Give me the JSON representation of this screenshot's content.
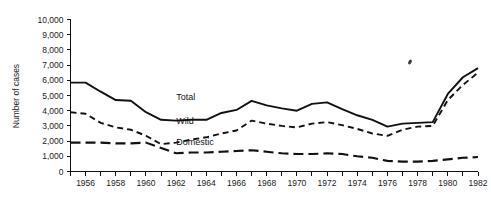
{
  "chart_data": {
    "type": "line",
    "title": "",
    "xlabel": "",
    "ylabel": "Number of cases",
    "xlim": [
      1955,
      1982
    ],
    "ylim": [
      0,
      10000
    ],
    "grid": false,
    "legend": "inline-labels",
    "y_ticks": [
      0,
      1000,
      2000,
      3000,
      4000,
      5000,
      6000,
      7000,
      8000,
      9000,
      10000
    ],
    "y_tick_labels": [
      "0",
      "1,000",
      "2,000",
      "3,000",
      "4,000",
      "5,000",
      "6,000",
      "7,000",
      "8,000",
      "9,000",
      "10,000"
    ],
    "x_ticks": [
      1955,
      1956,
      1957,
      1958,
      1959,
      1960,
      1961,
      1962,
      1963,
      1964,
      1965,
      1966,
      1967,
      1968,
      1969,
      1970,
      1971,
      1972,
      1973,
      1974,
      1975,
      1976,
      1977,
      1978,
      1979,
      1980,
      1981,
      1982
    ],
    "x_tick_labels": [
      "1956",
      "1958",
      "1960",
      "1962",
      "1964",
      "1966",
      "1968",
      "1970",
      "1972",
      "1974",
      "1976",
      "1978",
      "1980",
      "1982"
    ],
    "x_labeled_years": [
      1956,
      1958,
      1960,
      1962,
      1964,
      1966,
      1968,
      1970,
      1972,
      1974,
      1976,
      1978,
      1980,
      1982
    ],
    "x": [
      1955,
      1956,
      1957,
      1958,
      1959,
      1960,
      1961,
      1962,
      1963,
      1964,
      1965,
      1966,
      1967,
      1968,
      1969,
      1970,
      1971,
      1972,
      1973,
      1974,
      1975,
      1976,
      1977,
      1978,
      1979,
      1980,
      1981,
      1982
    ],
    "series": [
      {
        "name": "Total",
        "line_style": "solid",
        "color": "#111111",
        "label_x": 1962,
        "label_y": 4700,
        "values": [
          5850,
          5850,
          5250,
          4700,
          4650,
          3900,
          3400,
          3350,
          3400,
          3400,
          3850,
          4050,
          4650,
          4350,
          4150,
          4000,
          4450,
          4550,
          4100,
          3700,
          3400,
          2950,
          3150,
          3200,
          3250,
          5100,
          6200,
          6800
        ]
      },
      {
        "name": "Wild",
        "line_style": "short-dash",
        "color": "#111111",
        "label_x": 1962,
        "label_y": 3100,
        "values": [
          3900,
          3800,
          3200,
          2900,
          2750,
          2350,
          1800,
          1900,
          2100,
          2250,
          2500,
          2700,
          3350,
          3150,
          3000,
          2900,
          3150,
          3250,
          3050,
          2800,
          2500,
          2350,
          2750,
          2950,
          3000,
          4700,
          5700,
          6500
        ]
      },
      {
        "name": "Domestic",
        "line_style": "long-dash",
        "color": "#111111",
        "label_x": 1962,
        "label_y": 1750,
        "values": [
          1900,
          1900,
          1900,
          1850,
          1850,
          1900,
          1550,
          1200,
          1250,
          1250,
          1300,
          1350,
          1400,
          1300,
          1200,
          1150,
          1150,
          1200,
          1150,
          1000,
          900,
          700,
          650,
          650,
          700,
          800,
          900,
          950
        ]
      }
    ]
  }
}
